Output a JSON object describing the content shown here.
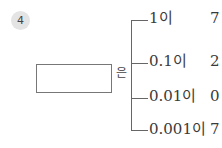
{
  "problem": {
    "number": "4",
    "particle": "은",
    "answer": "",
    "rows": [
      {
        "place": "1이",
        "digit": "7"
      },
      {
        "place": "0.1이",
        "digit": "2"
      },
      {
        "place": "0.01이",
        "digit": "0"
      },
      {
        "place": "0.001이",
        "digit": "7"
      }
    ]
  }
}
